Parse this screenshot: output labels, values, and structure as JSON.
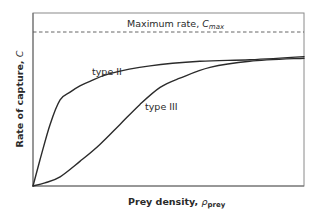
{
  "chart_data": {
    "type": "line",
    "title": "",
    "xlabel": "Prey density, ρ_prey",
    "xlabel_main": "Prey density, ",
    "xlabel_symbol": "ρ",
    "xlabel_sub": "prey",
    "ylabel": "Rate of capture, C",
    "ylabel_main": "Rate of capture, ",
    "ylabel_symbol": "C",
    "xlim": [
      0,
      1
    ],
    "ylim": [
      0,
      1.1
    ],
    "grid": false,
    "legend": "none (inline labels)",
    "annotations": [
      {
        "text": "Maximum rate, C_max",
        "main": "Maximum rate, ",
        "symbol": "C",
        "sub": "max",
        "type": "horizontal-dashed-line",
        "y": 1.0
      },
      {
        "text": "type II",
        "x": 0.22,
        "y": 0.72
      },
      {
        "text": "type III",
        "x": 0.5,
        "y": 0.62
      }
    ],
    "series": [
      {
        "name": "type II",
        "x": [
          0,
          0.026,
          0.063,
          0.1,
          0.137,
          0.173,
          0.21,
          0.284,
          0.432,
          0.616,
          0.8,
          1.0
        ],
        "values": [
          0,
          0.17,
          0.4,
          0.56,
          0.61,
          0.65,
          0.68,
          0.73,
          0.78,
          0.81,
          0.82,
          0.84
        ]
      },
      {
        "name": "type III",
        "x": [
          0,
          0.044,
          0.1,
          0.173,
          0.247,
          0.321,
          0.395,
          0.469,
          0.542,
          0.653,
          0.8,
          1.0
        ],
        "values": [
          0,
          0.02,
          0.06,
          0.16,
          0.27,
          0.4,
          0.53,
          0.64,
          0.7,
          0.77,
          0.81,
          0.83
        ]
      }
    ],
    "colors": {
      "curve": "#2b2b2b",
      "frame": "#8a8a8a",
      "dashed": "#555555",
      "text": "#2a2a2a"
    }
  }
}
